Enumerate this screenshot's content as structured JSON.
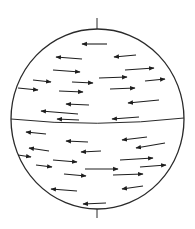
{
  "figure": {
    "kind": "globe-zonal-flow-diagram",
    "colors": {
      "stroke": "#2a2a2a",
      "arrow": "#1e1e1e",
      "background": "#ffffff"
    },
    "globe": {
      "cx": 97.5,
      "cy": 119,
      "rx": 86.5,
      "ry": 90
    },
    "poles": [
      {
        "name": "north-pole-axis",
        "x": 97,
        "y1": 18,
        "y2": 29
      },
      {
        "name": "south-pole-axis",
        "x": 97,
        "y1": 209,
        "y2": 218
      }
    ],
    "equator": {
      "x1": 11,
      "y1": 119,
      "cx": 97,
      "cy": 128,
      "x2": 184,
      "y2": 118
    },
    "edge_ticks": [
      {
        "x1": 18,
        "y1": 88,
        "x2": 38,
        "y2": 90
      },
      {
        "x1": 164,
        "y1": 89,
        "x2": 181,
        "y2": 88
      }
    ],
    "arrows": [
      {
        "dir": "west",
        "x1": 107,
        "y1": 44,
        "x2": 82,
        "y2": 44
      },
      {
        "dir": "west",
        "x1": 82,
        "y1": 59,
        "x2": 56,
        "y2": 57
      },
      {
        "dir": "west",
        "x1": 136,
        "y1": 55,
        "x2": 114,
        "y2": 57
      },
      {
        "dir": "east",
        "x1": 53,
        "y1": 70,
        "x2": 80,
        "y2": 72
      },
      {
        "dir": "east",
        "x1": 125,
        "y1": 70,
        "x2": 154,
        "y2": 68
      },
      {
        "dir": "east",
        "x1": 33,
        "y1": 80,
        "x2": 51,
        "y2": 82
      },
      {
        "dir": "east",
        "x1": 72,
        "y1": 82,
        "x2": 93,
        "y2": 83
      },
      {
        "dir": "east",
        "x1": 99,
        "y1": 78,
        "x2": 127,
        "y2": 77
      },
      {
        "dir": "east",
        "x1": 145,
        "y1": 81,
        "x2": 165,
        "y2": 79
      },
      {
        "dir": "east",
        "x1": 18,
        "y1": 88,
        "x2": 38,
        "y2": 90
      },
      {
        "dir": "east",
        "x1": 59,
        "y1": 91,
        "x2": 83,
        "y2": 92
      },
      {
        "dir": "east",
        "x1": 110,
        "y1": 89,
        "x2": 135,
        "y2": 88
      },
      {
        "dir": "west",
        "x1": 89,
        "y1": 105,
        "x2": 66,
        "y2": 104
      },
      {
        "dir": "west",
        "x1": 159,
        "y1": 100,
        "x2": 128,
        "y2": 103
      },
      {
        "dir": "west",
        "x1": 78,
        "y1": 114,
        "x2": 41,
        "y2": 111
      },
      {
        "dir": "west",
        "x1": 79,
        "y1": 120,
        "x2": 57,
        "y2": 119
      },
      {
        "dir": "west",
        "x1": 139,
        "y1": 117,
        "x2": 112,
        "y2": 119
      },
      {
        "dir": "west",
        "x1": 46,
        "y1": 134,
        "x2": 26,
        "y2": 132
      },
      {
        "dir": "west",
        "x1": 88,
        "y1": 142,
        "x2": 66,
        "y2": 141
      },
      {
        "dir": "west",
        "x1": 147,
        "y1": 137,
        "x2": 122,
        "y2": 140
      },
      {
        "dir": "west",
        "x1": 49,
        "y1": 151,
        "x2": 29,
        "y2": 148
      },
      {
        "dir": "west",
        "x1": 101,
        "y1": 151,
        "x2": 81,
        "y2": 152
      },
      {
        "dir": "west",
        "x1": 165,
        "y1": 143,
        "x2": 136,
        "y2": 148
      },
      {
        "dir": "east",
        "x1": 18,
        "y1": 155,
        "x2": 31,
        "y2": 157
      },
      {
        "dir": "east",
        "x1": 53,
        "y1": 160,
        "x2": 77,
        "y2": 162
      },
      {
        "dir": "east",
        "x1": 120,
        "y1": 160,
        "x2": 153,
        "y2": 158
      },
      {
        "dir": "east",
        "x1": 140,
        "y1": 167,
        "x2": 166,
        "y2": 165
      },
      {
        "dir": "east",
        "x1": 36,
        "y1": 165,
        "x2": 52,
        "y2": 167
      },
      {
        "dir": "east",
        "x1": 64,
        "y1": 174,
        "x2": 86,
        "y2": 176
      },
      {
        "dir": "east",
        "x1": 85,
        "y1": 169,
        "x2": 118,
        "y2": 169
      },
      {
        "dir": "east",
        "x1": 113,
        "y1": 175,
        "x2": 143,
        "y2": 174
      },
      {
        "dir": "west",
        "x1": 77,
        "y1": 191,
        "x2": 51,
        "y2": 189
      },
      {
        "dir": "west",
        "x1": 143,
        "y1": 186,
        "x2": 122,
        "y2": 189
      },
      {
        "dir": "west",
        "x1": 106,
        "y1": 203,
        "x2": 83,
        "y2": 204
      }
    ]
  }
}
